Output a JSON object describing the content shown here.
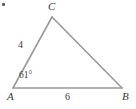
{
  "figure": {
    "type": "geometry-diagram",
    "shape": "triangle",
    "background_color": "#ffffff",
    "stroke_color": "#999999",
    "text_color": "#3a3a3a",
    "vertices": {
      "A": {
        "label": "A",
        "x": 13,
        "y": 88
      },
      "B": {
        "label": "B",
        "x": 122,
        "y": 88
      },
      "C": {
        "label": "C",
        "x": 52,
        "y": 17
      }
    },
    "sides": {
      "AC": {
        "label": "4",
        "value": 4
      },
      "AB": {
        "label": "6",
        "value": 6
      },
      "CB": {
        "label": "",
        "value": null
      }
    },
    "angles": {
      "A": {
        "label": "61°",
        "value": 61,
        "unit": "degrees"
      }
    },
    "marks": {
      "corner_artifact": true
    }
  }
}
